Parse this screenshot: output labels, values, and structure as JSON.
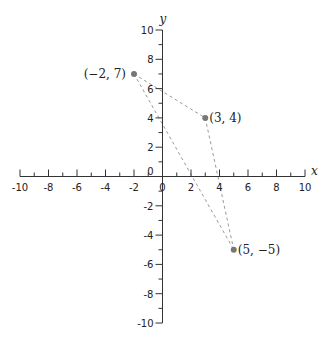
{
  "chart_data": {
    "type": "scatter",
    "title": "",
    "xlabel": "x",
    "ylabel": "y",
    "xlim": [
      -10,
      10
    ],
    "ylim": [
      -10,
      10
    ],
    "grid": false,
    "x_ticks_major": [
      -10,
      -8,
      -6,
      -4,
      -2,
      0,
      2,
      4,
      6,
      8,
      10
    ],
    "y_ticks_major": [
      -10,
      -8,
      -6,
      -4,
      -2,
      0,
      2,
      4,
      6,
      8,
      10
    ],
    "minor_tick_step": 1,
    "points": [
      {
        "x": -2,
        "y": 7,
        "label": "(−2, 7)"
      },
      {
        "x": 3,
        "y": 4,
        "label": "(3, 4)"
      },
      {
        "x": 5,
        "y": -5,
        "label": "(5, −5)"
      }
    ],
    "segments": [
      {
        "from": [
          -2,
          7
        ],
        "to": [
          3,
          4
        ],
        "style": "dashed"
      },
      {
        "from": [
          3,
          4
        ],
        "to": [
          5,
          -5
        ],
        "style": "dashed"
      },
      {
        "from": [
          -2,
          7
        ],
        "to": [
          5,
          -5
        ],
        "style": "dashed"
      }
    ],
    "colors": {
      "axis": "#333333",
      "point": "#777777",
      "dashed_line": "#999999"
    }
  }
}
